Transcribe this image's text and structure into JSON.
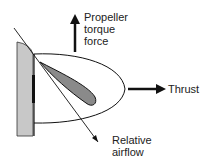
{
  "labels": {
    "torque": [
      "Propeller",
      "torque",
      "force"
    ],
    "thrust": "Thrust",
    "airflow": [
      "Relative",
      "airflow"
    ]
  },
  "colors": {
    "wall": "#c8c8c8",
    "blade": "#8a8a8a",
    "line": "#111111"
  }
}
